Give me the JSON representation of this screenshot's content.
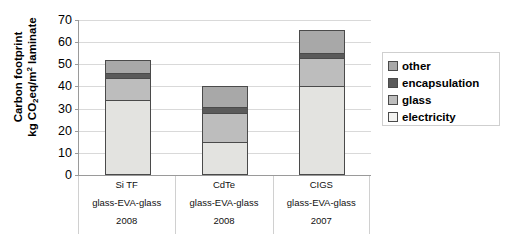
{
  "chart_data": {
    "type": "bar",
    "subtype": "stacked-vertical",
    "title": "",
    "xlabel": "",
    "ylabel": "Carbon footprint kg CO2eq/m2 laminate",
    "ylabel_line1": "Carbon footprint",
    "ylabel_line2_pre": "kg CO",
    "ylabel_line2_sub": "2",
    "ylabel_line2_mid": "eq/m",
    "ylabel_line2_sup": "2",
    "ylabel_line2_post": " laminate",
    "ylim": [
      0,
      70
    ],
    "ytick_step": 10,
    "yticks": [
      70,
      60,
      50,
      40,
      30,
      20,
      10,
      0
    ],
    "grid": true,
    "legend_position": "right",
    "categories": [
      "Si TF",
      "CdTe",
      "CIGS"
    ],
    "category_sublabels": [
      "glass-EVA-glass",
      "glass-EVA-glass",
      "glass-EVA-glass"
    ],
    "category_years": [
      "2008",
      "2008",
      "2007"
    ],
    "series": [
      {
        "name": "electricity",
        "values": [
          34.0,
          15.0,
          40.0
        ],
        "color": "#e3e3e0"
      },
      {
        "name": "glass",
        "values": [
          10.0,
          13.0,
          13.0
        ],
        "color": "#bdbdbd"
      },
      {
        "name": "encapsulation",
        "values": [
          2.0,
          2.5,
          2.0
        ],
        "color": "#5a5a5a"
      },
      {
        "name": "other",
        "values": [
          6.0,
          9.5,
          10.5
        ],
        "color": "#a8a8a8"
      }
    ],
    "totals": [
      52.0,
      40.0,
      65.5
    ],
    "stack_order_bottom_to_top": [
      "electricity",
      "glass",
      "encapsulation",
      "other"
    ]
  },
  "legend": {
    "items": [
      {
        "label": "other",
        "color": "#a8a8a8"
      },
      {
        "label": "encapsulation",
        "color": "#5a5a5a"
      },
      {
        "label": "glass",
        "color": "#bdbdbd"
      },
      {
        "label": "electricity",
        "color": "#f2f2f0"
      }
    ]
  },
  "axis": {
    "line_color": "#9a9a9a",
    "grid_color": "#d9d9d9",
    "bar_outline": "#4a4a4a"
  }
}
